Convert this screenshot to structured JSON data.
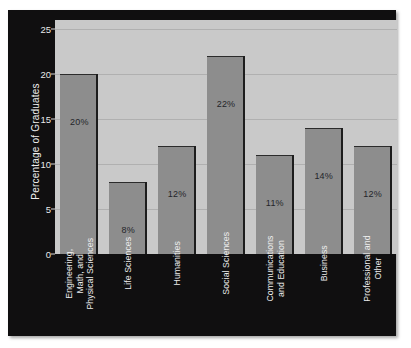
{
  "chart_data": {
    "type": "bar",
    "title": "",
    "xlabel": "",
    "ylabel": "Percentage of Graduates",
    "ylim": [
      0,
      26
    ],
    "yticks": [
      0,
      5,
      10,
      15,
      20,
      25
    ],
    "ytick_labels": [
      "0",
      "5",
      "10",
      "15",
      "20",
      "25"
    ],
    "grid": true,
    "legend": "none",
    "categories": [
      "Engineering,\nMath, and\nPhysical Sciences",
      "Life Sciences",
      "Humanities",
      "Social Sciences",
      "Communications\nand Education",
      "Business",
      "Professional and\nOther"
    ],
    "values": [
      20,
      8,
      12,
      22,
      11,
      14,
      12
    ],
    "data_labels": [
      "20%",
      "8%",
      "12%",
      "22%",
      "11%",
      "14%",
      "12%"
    ],
    "bars": [
      {
        "category_lines": [
          "Engineering,",
          "Math, and",
          "Physical Sciences"
        ],
        "value": 20,
        "label": "20%"
      },
      {
        "category_lines": [
          "Life Sciences"
        ],
        "value": 8,
        "label": "8%"
      },
      {
        "category_lines": [
          "Humanities"
        ],
        "value": 12,
        "label": "12%"
      },
      {
        "category_lines": [
          "Social Sciences"
        ],
        "value": 22,
        "label": "22%"
      },
      {
        "category_lines": [
          "Communications",
          "and Education"
        ],
        "value": 11,
        "label": "11%"
      },
      {
        "category_lines": [
          "Business"
        ],
        "value": 14,
        "label": "14%"
      },
      {
        "category_lines": [
          "Professional and",
          "Other"
        ],
        "value": 12,
        "label": "12%"
      }
    ],
    "colors": {
      "bar_fill": "#8d8d8d",
      "bar_edge": "#1d1d1d",
      "plot_background": "#c9c9c9",
      "canvas_background": "#100f10",
      "gridline": "#b0b0b0",
      "axis_text": "#ededed",
      "data_label_text": "#24252a",
      "figure_background": "#ffffff"
    }
  }
}
